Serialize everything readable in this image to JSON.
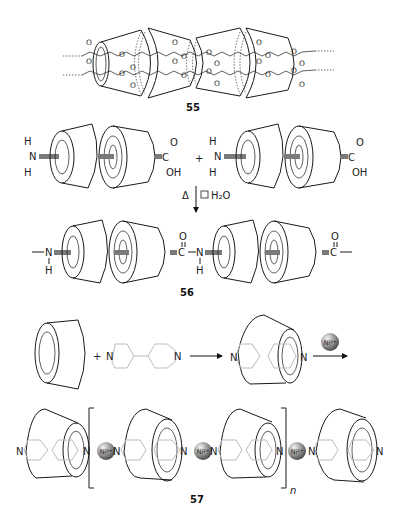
{
  "figure": {
    "compounds": [
      {
        "id": "55",
        "label": "55",
        "description": "linked cyclodextrin pairs via ester linkages"
      },
      {
        "id": "56",
        "label": "56",
        "description": "amide-linked cyclodextrin dimer chain"
      },
      {
        "id": "57",
        "label": "57",
        "description": "Ni2+ coordinated bipyridine-cyclodextrin polymer"
      }
    ],
    "reaction_56": {
      "left_amine": {
        "H_top": "H",
        "N": "N",
        "H_bottom": "H"
      },
      "acid": {
        "C": "C",
        "O": "O",
        "OH": "OH"
      },
      "plus": "+",
      "conditions": {
        "heat": "Δ",
        "minus": "□",
        "byproduct": "H₂O"
      },
      "product_labels": {
        "N": "N",
        "H": "H",
        "C": "C",
        "O": "O"
      }
    },
    "reaction_57": {
      "plus": "+",
      "bipyridine_N": "N",
      "reagent": "Ni2+",
      "ni_label": "Ni²⁺",
      "repeat_subscript": "n"
    },
    "ester_labels": {
      "O": "O"
    }
  }
}
